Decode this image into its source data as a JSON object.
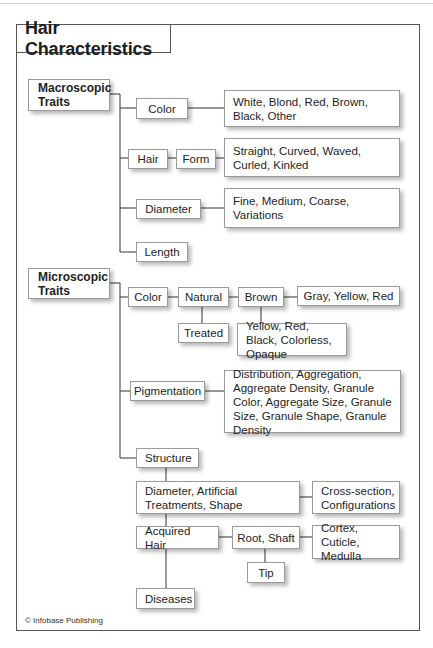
{
  "title": "Hair Characteristics",
  "macroscopic": {
    "label": "Macroscopic Traits",
    "color": {
      "label": "Color",
      "values": "White, Blond, Red, Brown, Black, Other"
    },
    "hair": {
      "label": "Hair",
      "form_label": "Form",
      "values": "Straight, Curved, Waved, Curled, Kinked"
    },
    "diameter": {
      "label": "Diameter",
      "values": "Fine, Medium, Coarse, Variations"
    },
    "length": {
      "label": "Length"
    }
  },
  "microscopic": {
    "label": "Microscopic Traits",
    "color": {
      "label": "Color",
      "natural": "Natural",
      "treated": "Treated",
      "brown": "Brown",
      "brown_values_side": "Gray, Yellow, Red",
      "brown_values_below": "Yellow, Red, Black, Colorless, Opaque"
    },
    "pigmentation": {
      "label": "Pigmentation",
      "values": "Distribution, Aggregation, Aggregate Density, Granule Color, Aggregate Size, Granule Size, Granule Shape, Granule Density"
    },
    "structure": {
      "label": "Structure",
      "diameter": "Diameter, Artificial Treatments, Shape",
      "diameter_values": "Cross-section, Configurations",
      "acquired": "Acquired Hair",
      "root_shaft": "Root, Shaft",
      "root_shaft_values": "Cortex, Cuticle, Medulla",
      "tip": "Tip",
      "diseases": "Diseases"
    }
  },
  "credit": "© Infobase Publishing",
  "colors": {
    "line": "#333333",
    "box_border": "#9a9a9a",
    "frame": "#555555"
  }
}
